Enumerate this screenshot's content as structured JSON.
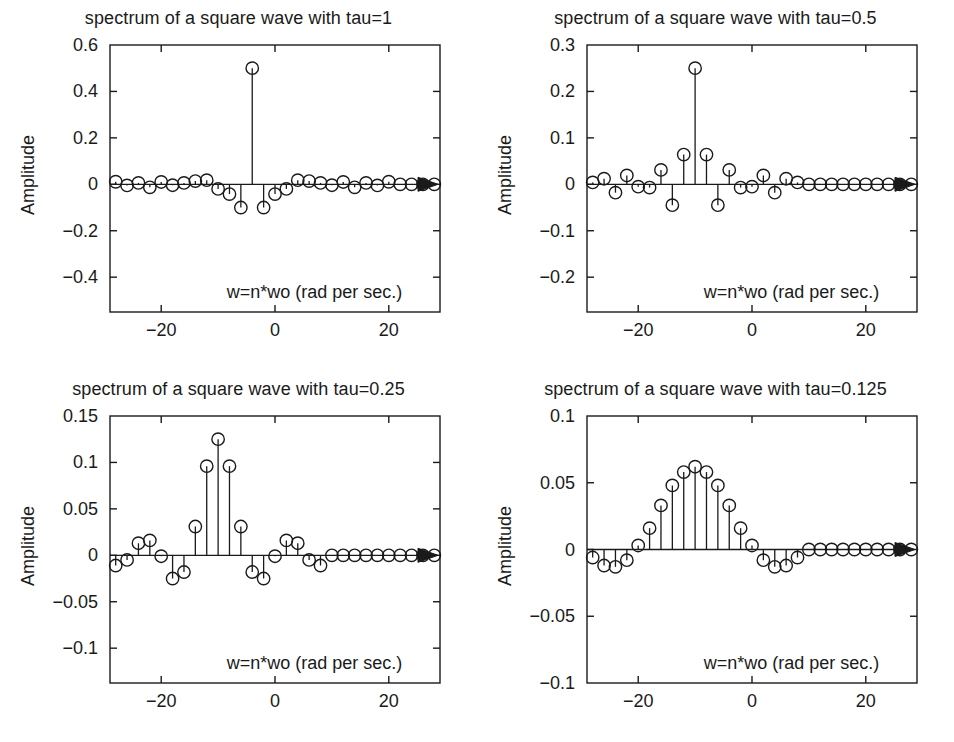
{
  "figure": {
    "background": "#ffffff",
    "ink": "#1a1a1a",
    "layout": "2x2 subplot grid",
    "ylabel": "Amplitude",
    "xnote": "w=n*wo (rad per sec.)",
    "xticklabels": [
      "-20",
      "0",
      "20"
    ],
    "xtickvalues": [
      -20,
      0,
      20
    ],
    "xlim": [
      -29,
      29
    ]
  },
  "panels": [
    {
      "id": "tau-1",
      "title": "spectrum of a square wave with tau=1",
      "ylabel": "Amplitude",
      "xnote": "w=n*wo (rad per sec.)",
      "yticklabels": [
        "0.6",
        "0.4",
        "0.2",
        "0",
        "-0.2",
        "-0.4"
      ],
      "ytickvalues": [
        0.6,
        0.4,
        0.2,
        0,
        -0.2,
        -0.4
      ],
      "ylim": [
        -0.55,
        0.6
      ],
      "xticklabels": [
        "-20",
        "0",
        "20"
      ]
    },
    {
      "id": "tau-0.5",
      "title": "spectrum of a square wave with tau=0.5",
      "ylabel": "Amplitude",
      "xnote": "w=n*wo (rad per sec.)",
      "yticklabels": [
        "0.3",
        "0.2",
        "0.1",
        "0",
        "-0.1",
        "-0.2"
      ],
      "ytickvalues": [
        0.3,
        0.2,
        0.1,
        0,
        -0.1,
        -0.2
      ],
      "ylim": [
        -0.275,
        0.3
      ],
      "xticklabels": [
        "-20",
        "0",
        "20"
      ]
    },
    {
      "id": "tau-0.25",
      "title": "spectrum of a square wave with tau=0.25",
      "ylabel": "Amplitude",
      "xnote": "w=n*wo (rad per sec.)",
      "yticklabels": [
        "0.15",
        "0.1",
        "0.05",
        "0",
        "-0.05",
        "-0.1"
      ],
      "ytickvalues": [
        0.15,
        0.1,
        0.05,
        0,
        -0.05,
        -0.1
      ],
      "ylim": [
        -0.1375,
        0.15
      ],
      "xticklabels": [
        "-20",
        "0",
        "20"
      ]
    },
    {
      "id": "tau-0.125",
      "title": "spectrum of a square wave with tau=0.125",
      "ylabel": "Amplitude",
      "xnote": "w=n*wo (rad per sec.)",
      "yticklabels": [
        "0.1",
        "0.05",
        "0",
        "-0.05",
        "-0.1"
      ],
      "ytickvalues": [
        0.1,
        0.05,
        0,
        -0.05,
        -0.1
      ],
      "ylim": [
        -0.1,
        0.1
      ],
      "xticklabels": [
        "-20",
        "0",
        "20"
      ]
    }
  ],
  "chart_data": [
    {
      "type": "scatter",
      "subtype": "stem",
      "title": "spectrum of a square wave with tau=1",
      "xlabel": "w=n*wo (rad per sec.)",
      "ylabel": "Amplitude",
      "xlim": [
        -29,
        29
      ],
      "ylim": [
        -0.55,
        0.6
      ],
      "xticks": [
        -20,
        0,
        20
      ],
      "yticks": [
        0.6,
        0.4,
        0.2,
        0,
        -0.2,
        -0.4
      ],
      "grid": false,
      "legend": null,
      "marker": "open-circle",
      "baseline_arrow": true,
      "x": [
        -28,
        -26,
        -24,
        -22,
        -20,
        -18,
        -16,
        -14,
        -12,
        -10,
        -8,
        -6,
        -4,
        -2,
        0,
        2,
        4,
        6,
        8,
        10,
        12,
        14,
        16,
        18,
        20,
        22,
        24,
        26,
        28
      ],
      "y": [
        0.011,
        -0.005,
        0.006,
        -0.013,
        0.01,
        -0.004,
        0.006,
        0.014,
        0.018,
        -0.02,
        -0.042,
        -0.1,
        0.5,
        -0.1,
        -0.042,
        -0.02,
        0.018,
        0.014,
        0.006,
        -0.004,
        0.01,
        -0.013,
        0.006,
        -0.005,
        0.011,
        0.0,
        0.0,
        0.0,
        0.0
      ]
    },
    {
      "type": "scatter",
      "subtype": "stem",
      "title": "spectrum of a square wave with tau=0.5",
      "xlabel": "w=n*wo (rad per sec.)",
      "ylabel": "Amplitude",
      "xlim": [
        -29,
        29
      ],
      "ylim": [
        -0.275,
        0.3
      ],
      "xticks": [
        -20,
        0,
        20
      ],
      "yticks": [
        0.3,
        0.2,
        0.1,
        0,
        -0.1,
        -0.2
      ],
      "grid": false,
      "legend": null,
      "marker": "open-circle",
      "baseline_arrow": true,
      "x": [
        -28,
        -26,
        -24,
        -22,
        -20,
        -18,
        -16,
        -14,
        -12,
        -10,
        -8,
        -6,
        -4,
        -2,
        0,
        2,
        4,
        6,
        8,
        10,
        12,
        14,
        16,
        18,
        20,
        22,
        24,
        26,
        28
      ],
      "y": [
        0.004,
        0.012,
        -0.018,
        0.019,
        -0.005,
        -0.007,
        0.031,
        -0.045,
        0.064,
        0.25,
        0.064,
        -0.045,
        0.031,
        -0.007,
        -0.005,
        0.019,
        -0.018,
        0.012,
        0.004,
        0.0,
        0.0,
        0.0,
        0.0,
        0.0,
        0.0,
        0.0,
        0.0,
        0.0,
        0.0
      ]
    },
    {
      "type": "scatter",
      "subtype": "stem",
      "title": "spectrum of a square wave with tau=0.25",
      "xlabel": "w=n*wo (rad per sec.)",
      "ylabel": "Amplitude",
      "xlim": [
        -29,
        29
      ],
      "ylim": [
        -0.1375,
        0.15
      ],
      "xticks": [
        -20,
        0,
        20
      ],
      "yticks": [
        0.15,
        0.1,
        0.05,
        0,
        -0.05,
        -0.1
      ],
      "grid": false,
      "legend": null,
      "marker": "open-circle",
      "baseline_arrow": true,
      "x": [
        -28,
        -26,
        -24,
        -22,
        -20,
        -18,
        -16,
        -14,
        -12,
        -10,
        -8,
        -6,
        -4,
        -2,
        0,
        2,
        4,
        6,
        8,
        10,
        12,
        14,
        16,
        18,
        20,
        22,
        24,
        26,
        28
      ],
      "y": [
        -0.011,
        -0.005,
        0.013,
        0.016,
        -0.001,
        -0.025,
        -0.018,
        0.031,
        0.096,
        0.125,
        0.096,
        0.031,
        -0.018,
        -0.025,
        -0.001,
        0.016,
        0.013,
        -0.005,
        -0.011,
        0.0,
        0.0,
        0.0,
        0.0,
        0.0,
        0.0,
        0.0,
        0.0,
        0.0,
        0.0
      ]
    },
    {
      "type": "scatter",
      "subtype": "stem",
      "title": "spectrum of a square wave with tau=0.125",
      "xlabel": "w=n*wo (rad per sec.)",
      "ylabel": "Amplitude",
      "xlim": [
        -29,
        29
      ],
      "ylim": [
        -0.1,
        0.1
      ],
      "xticks": [
        -20,
        0,
        20
      ],
      "yticks": [
        0.1,
        0.05,
        0,
        -0.05,
        -0.1
      ],
      "grid": false,
      "legend": null,
      "marker": "open-circle",
      "baseline_arrow": true,
      "x": [
        -28,
        -26,
        -24,
        -22,
        -20,
        -18,
        -16,
        -14,
        -12,
        -10,
        -8,
        -6,
        -4,
        -2,
        0,
        2,
        4,
        6,
        8,
        10,
        12,
        14,
        16,
        18,
        20,
        22,
        24,
        26,
        28
      ],
      "y": [
        -0.006,
        -0.012,
        -0.013,
        -0.008,
        0.003,
        0.016,
        0.033,
        0.048,
        0.058,
        0.062,
        0.058,
        0.048,
        0.033,
        0.016,
        0.003,
        -0.008,
        -0.013,
        -0.012,
        -0.006,
        0.0,
        0.0,
        0.0,
        0.0,
        0.0,
        0.0,
        0.0,
        0.0,
        0.0,
        0.0
      ]
    }
  ]
}
